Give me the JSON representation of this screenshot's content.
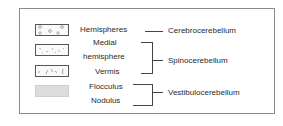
{
  "legend": {
    "swatches": [
      {
        "pattern": "open-circles",
        "label": "Hemispheres"
      },
      {
        "pattern": "scattered-dashes",
        "label": "Medial hemisphere"
      },
      {
        "pattern": "squiggles",
        "label": "Vermis"
      },
      {
        "pattern": "solid-gray",
        "label": "Flocculus / Nodulus"
      }
    ]
  },
  "parts": {
    "hemispheres": "Hemispheres",
    "medial_line1": "Medial",
    "medial_line2": "hemisphere",
    "vermis": "Vermis",
    "flocculus": "Flocculus",
    "nodulus": "Nodulus"
  },
  "divisions": {
    "cerebro": "Cerebrocerebellum",
    "spino": "Spinocerebellum",
    "vestibulo": "Vestibulocerebellum"
  },
  "colors": {
    "border": "#8a8a8a",
    "text": "#2a2a2a",
    "fill_gray": "#dcdcdc"
  }
}
